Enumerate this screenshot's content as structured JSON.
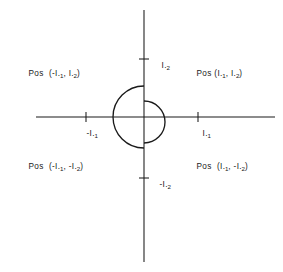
{
  "figure": {
    "background_color": "#ffffff",
    "stroke_color": "#1a1a1a"
  },
  "axes": {
    "origin": {
      "x": 144,
      "y": 117
    },
    "x_axis": {
      "from_x": 36,
      "to_x": 275,
      "y": 117
    },
    "y_axis": {
      "from_y": 10,
      "to_y": 262,
      "x": 144
    },
    "ticks": [
      {
        "name": "negative-x-tick",
        "x": 86,
        "y": 117,
        "label": "-I.1"
      },
      {
        "name": "positive-x-tick",
        "x": 198,
        "y": 117,
        "label": "I.1"
      },
      {
        "name": "positive-y-tick",
        "x": 144,
        "y": 59,
        "label": "I.2"
      },
      {
        "name": "negative-y-tick",
        "x": 144,
        "y": 178,
        "label": "-I.2"
      }
    ]
  },
  "tick_labels": {
    "positive_y": {
      "prefix": "",
      "symbol": "I",
      "dot": ".",
      "subscript": "2"
    },
    "negative_y": {
      "prefix": "-",
      "symbol": "I",
      "dot": ".",
      "subscript": "2"
    },
    "negative_x": {
      "prefix": "-",
      "symbol": "I",
      "dot": ".",
      "subscript": "1"
    },
    "positive_x": {
      "prefix": "",
      "symbol": "I",
      "dot": ".",
      "subscript": "1"
    }
  },
  "quadrant_labels": [
    {
      "name": "quadrant-2-label",
      "quadrant": "II",
      "pos_text": "Pos",
      "open_paren": "(",
      "first_sign": "-",
      "first_symbol": "I",
      "first_dot": ".",
      "first_subscript": "1",
      "comma": ",",
      "second_sign": "",
      "second_symbol": "I",
      "second_dot": ".",
      "second_subscript": "2",
      "close_paren": ")",
      "full_text": "Pos (-I.1, I.2)"
    },
    {
      "name": "quadrant-1-label",
      "quadrant": "I",
      "pos_text": "Pos",
      "open_paren": "(",
      "first_sign": "",
      "first_symbol": "I",
      "first_dot": ".",
      "first_subscript": "1",
      "comma": ",",
      "second_sign": "",
      "second_symbol": "I",
      "second_dot": ".",
      "second_subscript": "2",
      "close_paren": ")",
      "full_text": "Pos (I.1, I.2)"
    },
    {
      "name": "quadrant-3-label",
      "quadrant": "III",
      "pos_text": "Pos",
      "open_paren": "(",
      "first_sign": "-",
      "first_symbol": "I",
      "first_dot": ".",
      "first_subscript": "1",
      "comma": ",",
      "second_sign": "-",
      "second_symbol": "I",
      "second_dot": ".",
      "second_subscript": "2",
      "close_paren": ")",
      "full_text": "Pos (-I.1, -I.2)"
    },
    {
      "name": "quadrant-4-label",
      "quadrant": "IV",
      "pos_text": "Pos",
      "open_paren": "(",
      "first_sign": "",
      "first_symbol": "I",
      "first_dot": ".",
      "first_subscript": "1",
      "comma": ",",
      "second_sign": "-",
      "second_symbol": "I",
      "second_dot": ".",
      "second_subscript": "2",
      "close_paren": ")",
      "full_text": "Pos (I.1, -I.2)"
    }
  ],
  "arcs": [
    {
      "name": "large-left-arc",
      "description": "large arc bulging left from positive y-axis to negative y-axis",
      "start": {
        "x": 144,
        "y": 86
      },
      "end": {
        "x": 144,
        "y": 148
      },
      "radius": 31,
      "bulge": "left"
    },
    {
      "name": "small-right-arc",
      "description": "smaller arc bulging right from positive y-axis to negative y-axis",
      "start": {
        "x": 144,
        "y": 101
      },
      "end": {
        "x": 144,
        "y": 143
      },
      "radius": 21,
      "bulge": "right"
    }
  ]
}
